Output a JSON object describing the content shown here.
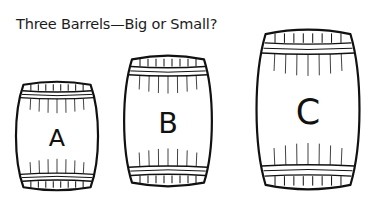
{
  "title": "Three Barrels—Big or Small?",
  "barrels": [
    {
      "id": "A",
      "label": "A"
    },
    {
      "id": "B",
      "label": "B"
    },
    {
      "id": "C",
      "label": "C"
    }
  ],
  "colors": {
    "stroke": "#111111",
    "background": "#ffffff"
  }
}
